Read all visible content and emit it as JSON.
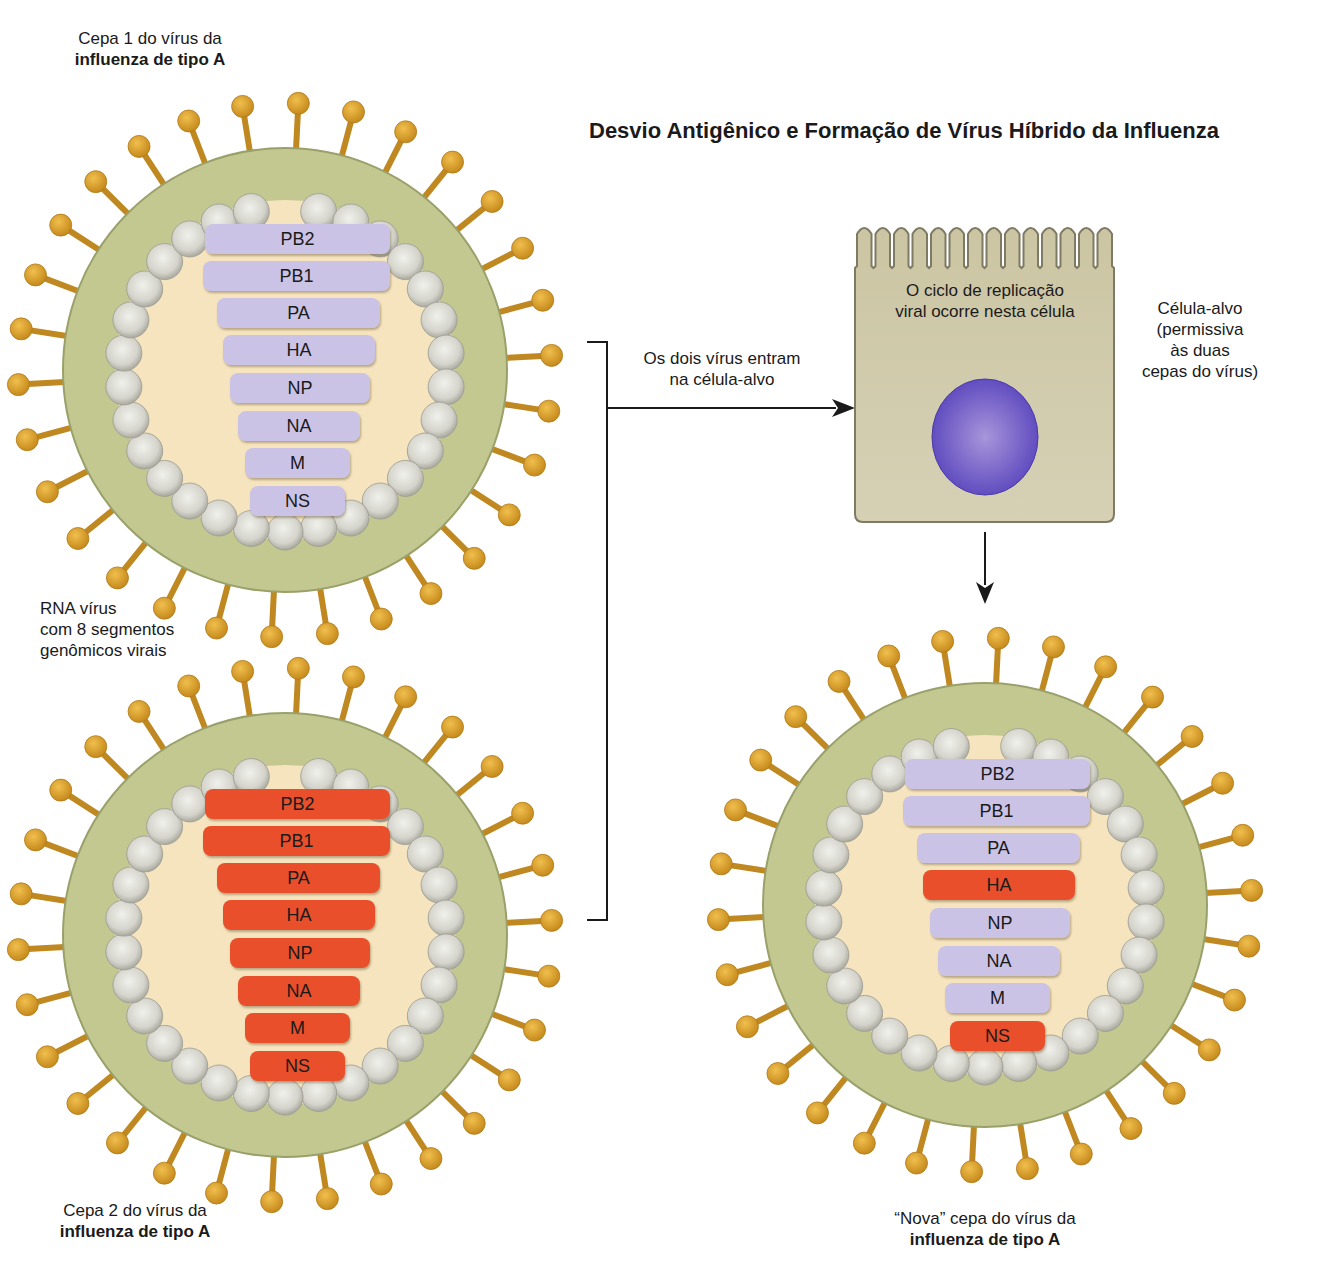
{
  "title": "Desvio Antigênico e Formação de Vírus Híbrido da Influenza",
  "colors": {
    "spike": "#d49a2a",
    "spike_dark": "#b07a18",
    "envelope": "#c3c891",
    "envelope_edge": "#9aa06a",
    "interior": "#f6e4be",
    "bead": "#d9d9d2",
    "bead_edge": "#9a9a90",
    "segment_strain1": "#cbc3e6",
    "segment_strain2": "#e8502a",
    "cell_body": "#cdc7a6",
    "cell_edge": "#7e7a64",
    "nucleus": "#6e5ac8",
    "arrow": "#1a1a1a"
  },
  "virus1": {
    "caption_line1": "Cepa 1 do vírus da",
    "caption_line2": "influenza de tipo A",
    "segments": [
      {
        "name": "PB2",
        "strain": 1
      },
      {
        "name": "PB1",
        "strain": 1
      },
      {
        "name": "PA",
        "strain": 1
      },
      {
        "name": "HA",
        "strain": 1
      },
      {
        "name": "NP",
        "strain": 1
      },
      {
        "name": "NA",
        "strain": 1
      },
      {
        "name": "M",
        "strain": 1
      },
      {
        "name": "NS",
        "strain": 1
      }
    ]
  },
  "rna_label": {
    "line1": "RNA vírus",
    "line2": "com 8 segmentos",
    "line3": "genômicos virais"
  },
  "virus2": {
    "caption_line1": "Cepa 2 do vírus da",
    "caption_line2": "influenza de tipo A",
    "segments": [
      {
        "name": "PB2",
        "strain": 2
      },
      {
        "name": "PB1",
        "strain": 2
      },
      {
        "name": "PA",
        "strain": 2
      },
      {
        "name": "HA",
        "strain": 2
      },
      {
        "name": "NP",
        "strain": 2
      },
      {
        "name": "NA",
        "strain": 2
      },
      {
        "name": "M",
        "strain": 2
      },
      {
        "name": "NS",
        "strain": 2
      }
    ]
  },
  "entry_label": {
    "line1": "Os dois vírus entram",
    "line2": "na célula-alvo"
  },
  "cell": {
    "inside_line1": "O ciclo de replicação",
    "inside_line2": "viral ocorre nesta célula",
    "side_line1": "Célula-alvo",
    "side_line2": "(permissiva",
    "side_line3": "às duas",
    "side_line4": "cepas do vírus)",
    "microvilli_count": 14
  },
  "virus3": {
    "caption_line1": "“Nova” cepa do vírus da",
    "caption_line2": "influenza de tipo A",
    "segments": [
      {
        "name": "PB2",
        "strain": 1
      },
      {
        "name": "PB1",
        "strain": 1
      },
      {
        "name": "PA",
        "strain": 1
      },
      {
        "name": "HA",
        "strain": 2
      },
      {
        "name": "NP",
        "strain": 1
      },
      {
        "name": "NA",
        "strain": 1
      },
      {
        "name": "M",
        "strain": 1
      },
      {
        "name": "NS",
        "strain": 2
      }
    ]
  }
}
